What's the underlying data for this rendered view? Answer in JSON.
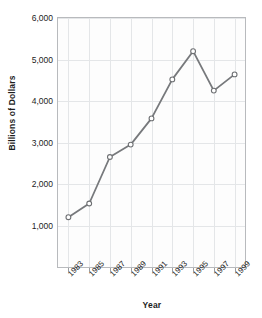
{
  "figure": {
    "clipped_title": "1983–2000",
    "background_color": "#ffffff"
  },
  "axes": {
    "y_title": "Billions of Dollars",
    "x_title": "Year",
    "y_ticks": [
      "1,000",
      "2,000",
      "3,000",
      "4,000",
      "5,000",
      "6,000"
    ],
    "x_ticks": [
      "1983",
      "1985",
      "1987",
      "1989",
      "1991",
      "1993",
      "1995",
      "1997",
      "1999"
    ],
    "frame_color": "#b8babd",
    "grid_color": "#e4e6e8"
  },
  "style": {
    "line_color": "#77797c",
    "marker_fill": "#ffffff",
    "marker_stroke": "#6e7073",
    "text_color": "#1d1d1d"
  },
  "chart_data": {
    "type": "line",
    "title": "1983–2000",
    "xlabel": "Year",
    "ylabel": "Billions of Dollars",
    "xlim": [
      1982,
      2000
    ],
    "ylim": [
      0,
      6000
    ],
    "grid": true,
    "legend": "none",
    "x": [
      1983,
      1985,
      1987,
      1989,
      1991,
      1993,
      1995,
      1997,
      1999
    ],
    "categories": [
      "1983",
      "1985",
      "1987",
      "1989",
      "1991",
      "1993",
      "1995",
      "1997",
      "1999"
    ],
    "values": [
      1200,
      1530,
      2650,
      2950,
      3580,
      4520,
      5200,
      4250,
      4640
    ],
    "series": [
      {
        "name": "Billions of Dollars",
        "values": [
          1200,
          1530,
          2650,
          2950,
          3580,
          4520,
          5200,
          4250,
          4640
        ]
      }
    ],
    "y_tick_values": [
      1000,
      2000,
      3000,
      4000,
      5000,
      6000
    ],
    "marker": "open-circle"
  }
}
